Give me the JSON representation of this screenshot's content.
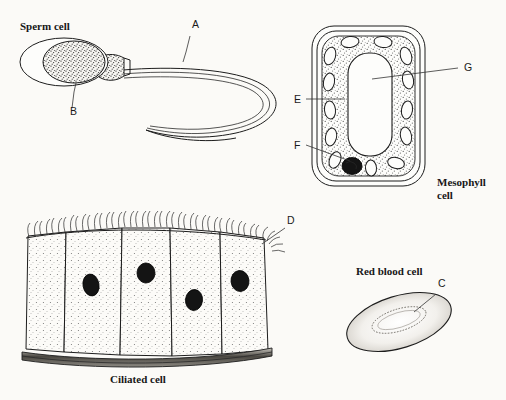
{
  "figure": {
    "background_color": "#fbfaf7",
    "ink_color": "#1d1d1d",
    "width": 506,
    "height": 400
  },
  "cells": [
    {
      "id": "sperm",
      "caption": "Sperm cell",
      "caption_pos": {
        "x": 20,
        "y": 30
      },
      "parts": [
        {
          "ref": "A",
          "target": "tail / flagellum"
        },
        {
          "ref": "B",
          "target": "head nucleus"
        }
      ]
    },
    {
      "id": "mesophyll",
      "caption": "Mesophyll",
      "caption_line2": "cell",
      "caption_pos": {
        "x": 437,
        "y": 186
      },
      "parts": [
        {
          "ref": "E",
          "target": "cytoplasm"
        },
        {
          "ref": "F",
          "target": "chloroplast"
        },
        {
          "ref": "G",
          "target": "vacuole"
        }
      ]
    },
    {
      "id": "ciliated",
      "caption": "Ciliated cell",
      "caption_pos": {
        "x": 110,
        "y": 383
      },
      "parts": [
        {
          "ref": "D",
          "target": "cilia"
        }
      ]
    },
    {
      "id": "red-blood",
      "caption": "Red blood cell",
      "caption_pos": {
        "x": 356,
        "y": 275
      },
      "parts": [
        {
          "ref": "C",
          "target": "cell surface membrane"
        }
      ]
    }
  ],
  "ref_labels": [
    {
      "ref": "A",
      "x": 192,
      "y": 28
    },
    {
      "ref": "B",
      "x": 70,
      "y": 115
    },
    {
      "ref": "C",
      "x": 438,
      "y": 287
    },
    {
      "ref": "D",
      "x": 287,
      "y": 224
    },
    {
      "ref": "E",
      "x": 297,
      "y": 102
    },
    {
      "ref": "F",
      "x": 297,
      "y": 148
    },
    {
      "ref": "G",
      "x": 464,
      "y": 71
    }
  ]
}
